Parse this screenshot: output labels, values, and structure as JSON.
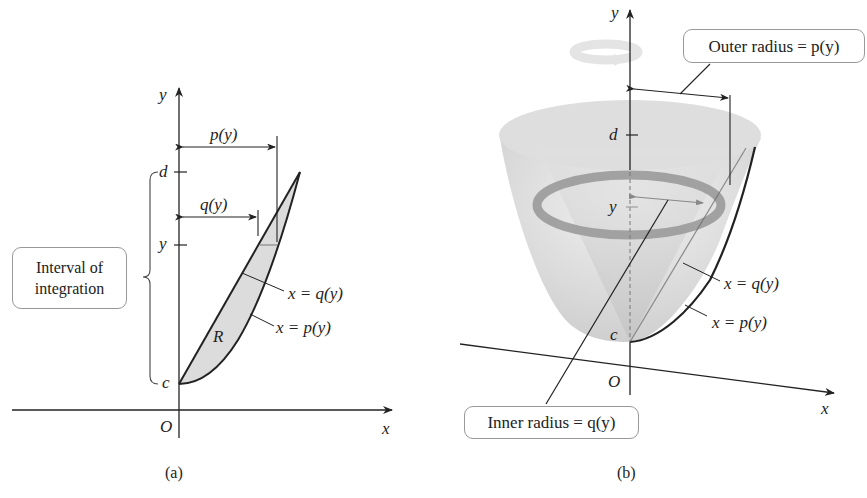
{
  "panel_a": {
    "caption": "(a)",
    "axis_x_label": "x",
    "axis_y_label": "y",
    "origin_label": "O",
    "tick_d": "d",
    "tick_y": "y",
    "tick_c": "c",
    "p_label": "p(y)",
    "q_label": "q(y)",
    "region_label": "R",
    "curve_q_label": "x = q(y)",
    "curve_p_label": "x = p(y)",
    "interval_box_line1": "Interval of",
    "interval_box_line2": "integration"
  },
  "panel_b": {
    "caption": "(b)",
    "axis_x_label": "x",
    "axis_y_label": "y",
    "origin_label": "O",
    "tick_d": "d",
    "tick_y": "y",
    "tick_c": "c",
    "curve_q_label": "x = q(y)",
    "curve_p_label": "x = p(y)",
    "outer_radius_label": "Outer radius = p(y)",
    "inner_radius_label": "Inner radius = q(y)"
  },
  "colors": {
    "ink": "#222222",
    "region_fill": "#dcdcdc",
    "solid_fill": "#e4e4e4",
    "ring": "#9a9a9a",
    "box_border": "#999999"
  }
}
